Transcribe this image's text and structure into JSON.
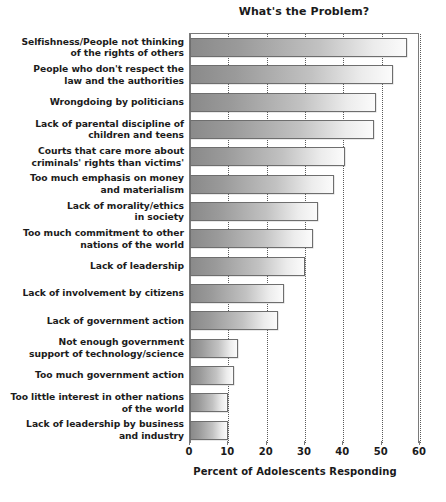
{
  "chart_data": {
    "type": "bar",
    "orientation": "horizontal",
    "title": "What's the Problem?",
    "xlabel": "Percent of Adolescents Responding",
    "ylabel": "",
    "xlim": [
      0,
      60
    ],
    "xticks": [
      0,
      10,
      20,
      30,
      40,
      50,
      60
    ],
    "xtick_labels": [
      "0",
      "10",
      "20",
      "30",
      "40",
      "50",
      "60"
    ],
    "grid": true,
    "grid_axis": "x",
    "grid_style": "dotted",
    "legend": false,
    "bar_style": "horizontal gradient dark-gray to white with gray outline",
    "categories": [
      "Selfishness/People not thinking of the rights of others",
      "People who don't respect the law and the authorities",
      "Wrongdoing by politicians",
      "Lack of parental discipline of children and teens",
      "Courts that care more about criminals' rights than victims'",
      "Too much emphasis on money and materialism",
      "Lack of morality/ethics in society",
      "Too much commitment to other nations of the world",
      "Lack of leadership",
      "Lack of involvement by citizens",
      "Lack of government action",
      "Not enough government support of technology/science",
      "Too much government action",
      "Too little interest in other nations of the world",
      "Lack of leadership by business and industry"
    ],
    "category_lines": [
      [
        "Selfishness/People not thinking",
        "of the rights of others"
      ],
      [
        "People who don't respect the",
        "law and the authorities"
      ],
      [
        "Wrongdoing by politicians"
      ],
      [
        "Lack of parental discipline of",
        "children and teens"
      ],
      [
        "Courts that care more about",
        "criminals' rights than victims'"
      ],
      [
        "Too much emphasis on money",
        "and materialism"
      ],
      [
        "Lack of morality/ethics",
        "in society"
      ],
      [
        "Too much commitment to other",
        "nations of the world"
      ],
      [
        "Lack of leadership"
      ],
      [
        "Lack of involvement by citizens"
      ],
      [
        "Lack of government action"
      ],
      [
        "Not enough government",
        "support of technology/science"
      ],
      [
        "Too much government action"
      ],
      [
        "Too little interest in other nations",
        "of the world"
      ],
      [
        "Lack of leadership by business",
        "and industry"
      ]
    ],
    "values": [
      56.5,
      53,
      48.5,
      48,
      40.5,
      37.5,
      33.5,
      32,
      30,
      24.5,
      23,
      12.5,
      11.5,
      10,
      9.8
    ]
  },
  "colors": {
    "bar_dark": "#8a8a8a",
    "bar_light": "#fbfbfb",
    "bar_border": "#6e6e6e",
    "grid": "#5a5a5a",
    "axis": "#7a7a7a",
    "text": "#1a1a1a",
    "background": "#ffffff"
  }
}
